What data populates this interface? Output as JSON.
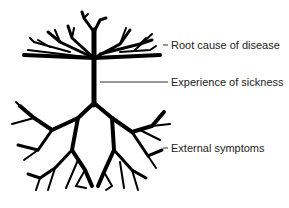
{
  "diagram": {
    "type": "tree metaphor of disease",
    "labels": {
      "root_cause": "Root cause of disease",
      "experience": "Experience of sickness",
      "external": "External symptoms"
    },
    "colors": {
      "tree": "#000000",
      "leader_lines": "#333333",
      "text": "#222222",
      "background": "#ffffff"
    }
  }
}
